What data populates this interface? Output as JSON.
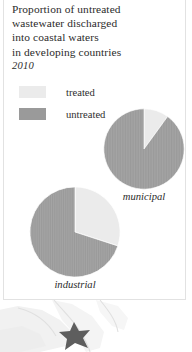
{
  "panel": {
    "title_lines": [
      "Proportion of untreated",
      "wastewater discharged",
      "into coastal waters",
      "in developing countries"
    ],
    "year": "2010"
  },
  "legend": {
    "items": [
      {
        "label": "treated",
        "color": "#ebebeb"
      },
      {
        "label": "untreated",
        "color": "#9a9a9a"
      }
    ]
  },
  "chart_data": [
    {
      "type": "pie",
      "title": "municipal",
      "categories": [
        "treated",
        "untreated"
      ],
      "values": [
        10,
        90
      ],
      "labels": [
        "10%",
        "90%"
      ],
      "colors": [
        "#ebebeb",
        "#9a9a9a"
      ],
      "start_angle": 0,
      "direction": "clockwise",
      "units": "percent"
    },
    {
      "type": "pie",
      "title": "industrial",
      "categories": [
        "treated",
        "untreated"
      ],
      "values": [
        30,
        70
      ],
      "labels": [
        "30%",
        "70%"
      ],
      "colors": [
        "#ebebeb",
        "#9a9a9a"
      ],
      "start_angle": 0,
      "direction": "clockwise",
      "units": "percent"
    }
  ]
}
